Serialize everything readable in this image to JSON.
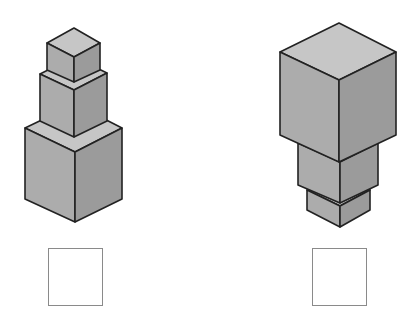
{
  "colors": {
    "top_face": "#c6c6c6",
    "left_face": "#acacac",
    "right_face": "#9b9b9b",
    "outline": "#222222",
    "answer_box_border": "#8a8a8a"
  },
  "figures": [
    {
      "name": "stack-left",
      "description": "Three cubes stacked, largest at bottom",
      "cubes": [
        {
          "name": "bottom-large",
          "top": [
            [
              75,
              104
            ],
            [
              25,
              128
            ],
            [
              75,
              152
            ],
            [
              122,
              128
            ]
          ],
          "left": [
            [
              25,
              128
            ],
            [
              75,
              152
            ],
            [
              75,
              222
            ],
            [
              25,
              199
            ]
          ],
          "right": [
            [
              75,
              152
            ],
            [
              122,
              128
            ],
            [
              122,
              199
            ],
            [
              75,
              222
            ]
          ]
        },
        {
          "name": "middle",
          "top": [
            [
              74,
              57
            ],
            [
              40,
              74
            ],
            [
              74,
              90
            ],
            [
              107,
              73
            ]
          ],
          "left": [
            [
              40,
              74
            ],
            [
              74,
              90
            ],
            [
              74,
              137
            ],
            [
              40,
              121
            ]
          ],
          "right": [
            [
              74,
              90
            ],
            [
              107,
              73
            ],
            [
              107,
              121
            ],
            [
              74,
              137
            ]
          ]
        },
        {
          "name": "top-small",
          "top": [
            [
              74,
              28
            ],
            [
              47,
              43
            ],
            [
              74,
              57
            ],
            [
              100,
              43
            ]
          ],
          "left": [
            [
              47,
              43
            ],
            [
              74,
              57
            ],
            [
              74,
              82
            ],
            [
              47,
              70
            ]
          ],
          "right": [
            [
              74,
              57
            ],
            [
              100,
              43
            ],
            [
              100,
              70
            ],
            [
              74,
              82
            ]
          ]
        }
      ]
    },
    {
      "name": "stack-right",
      "description": "Three cubes stacked, largest at top",
      "cubes": [
        {
          "name": "bottom-small",
          "top": [
            [
              340,
              175
            ],
            [
              307,
              190
            ],
            [
              340,
              206
            ],
            [
              370,
              190
            ]
          ],
          "left": [
            [
              307,
              190
            ],
            [
              340,
              206
            ],
            [
              340,
              227
            ],
            [
              307,
              210
            ]
          ],
          "right": [
            [
              340,
              206
            ],
            [
              370,
              190
            ],
            [
              370,
              210
            ],
            [
              340,
              227
            ]
          ]
        },
        {
          "name": "middle",
          "top": [
            [
              340,
              125
            ],
            [
              298,
              143
            ],
            [
              340,
              162
            ],
            [
              378,
              143
            ]
          ],
          "left": [
            [
              298,
              143
            ],
            [
              340,
              162
            ],
            [
              340,
              203
            ],
            [
              298,
              185
            ]
          ],
          "right": [
            [
              340,
              162
            ],
            [
              378,
              143
            ],
            [
              378,
              185
            ],
            [
              340,
              203
            ]
          ]
        },
        {
          "name": "top-large",
          "top": [
            [
              339,
              23
            ],
            [
              280,
              52
            ],
            [
              339,
              80
            ],
            [
              396,
              52
            ]
          ],
          "left": [
            [
              280,
              52
            ],
            [
              339,
              80
            ],
            [
              339,
              162
            ],
            [
              280,
              135
            ]
          ],
          "right": [
            [
              339,
              80
            ],
            [
              396,
              52
            ],
            [
              396,
              135
            ],
            [
              339,
              162
            ]
          ]
        }
      ]
    }
  ],
  "answer_boxes": [
    {
      "name": "answer-box-left",
      "x": 48,
      "y": 248,
      "value": ""
    },
    {
      "name": "answer-box-right",
      "x": 312,
      "y": 248,
      "value": ""
    }
  ]
}
